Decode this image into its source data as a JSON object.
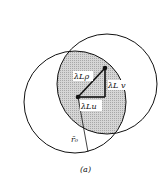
{
  "figure": {
    "caption": "(a)",
    "labels": {
      "hypotenuse": "λLρ",
      "vertical_leg": "λL v",
      "horizontal_leg": "λLu",
      "radius": "r̄₀"
    },
    "colors": {
      "stroke": "#111111",
      "overlap_fill": "#c8c8c8",
      "background": "#ffffff"
    }
  }
}
